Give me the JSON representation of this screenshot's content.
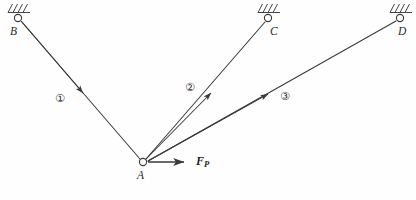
{
  "figure": {
    "caption": "",
    "background_color": "#fefefe",
    "line_color": "#3a3a3a",
    "label_color": "#2b2b2b"
  },
  "nodes": [
    {
      "id": "B",
      "label": "B",
      "x": 18,
      "y": 18,
      "type": "pin-support",
      "label_x": 10,
      "label_y": 26
    },
    {
      "id": "C",
      "label": "C",
      "x": 268,
      "y": 18,
      "type": "pin-support",
      "label_x": 270,
      "label_y": 26
    },
    {
      "id": "D",
      "label": "D",
      "x": 400,
      "y": 18,
      "type": "pin-support",
      "label_x": 398,
      "label_y": 26
    },
    {
      "id": "A",
      "label": "A",
      "x": 143,
      "y": 162,
      "type": "joint",
      "label_x": 137,
      "label_y": 170
    }
  ],
  "members": [
    {
      "id": "1",
      "label": "①",
      "from": "B",
      "to": "A",
      "arrow_toward": "A",
      "label_x": 55,
      "label_y": 93
    },
    {
      "id": "2",
      "label": "②",
      "from": "A",
      "to": "C",
      "arrow_toward": "C",
      "label_x": 185,
      "label_y": 82
    },
    {
      "id": "3",
      "label": "③",
      "from": "A",
      "to": "D",
      "arrow_toward": "D",
      "label_x": 280,
      "label_y": 91
    }
  ],
  "force": {
    "symbol": "F",
    "subscript": "P",
    "label_x": 196,
    "label_y": 155,
    "origin": {
      "x": 143,
      "y": 162
    },
    "tip": {
      "x": 186,
      "y": 162
    },
    "direction": "horizontal-right"
  },
  "support_symbol": {
    "kind": "hatched-ground-pin",
    "hatch_stroke_count": 4,
    "description": "small open circle with slanted hatch strokes above a ground line"
  }
}
